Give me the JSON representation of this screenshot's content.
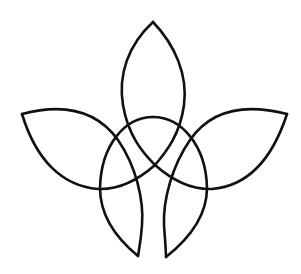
{
  "figure": {
    "background_color": "#ffffff",
    "stroke_color": "#111111",
    "petals": [
      "top-petal",
      "left-petal",
      "right-petal",
      "bottom-left-petal",
      "bottom-right-petal"
    ],
    "has_central_ring": true
  }
}
